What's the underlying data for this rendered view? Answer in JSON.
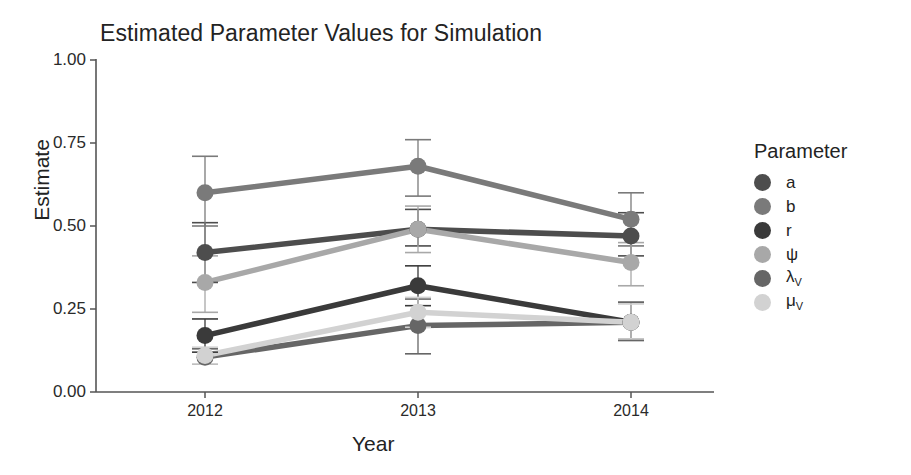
{
  "chart_data": {
    "type": "line",
    "title": "Estimated Parameter Values for Simulation",
    "xlabel": "Year",
    "ylabel": "Estimate",
    "x": [
      "2012",
      "2013",
      "2014"
    ],
    "categories": [
      "2012",
      "2013",
      "2014"
    ],
    "xtick_labels": [
      "2012",
      "2013",
      "2014"
    ],
    "ytick_labels": [
      "0.00",
      "0.25",
      "0.50",
      "0.75",
      "1.00"
    ],
    "ytick_values": [
      0.0,
      0.25,
      0.5,
      0.75,
      1.0
    ],
    "ylim": [
      0.0,
      1.0
    ],
    "grid": false,
    "legend_title": "Parameter",
    "legend_position": "right",
    "error_bars": "vertical, symmetric caps",
    "series": [
      {
        "name": "a",
        "label": "a",
        "color": "#4d4d4d",
        "values": [
          0.42,
          0.49,
          0.47
        ],
        "err_low": [
          0.33,
          0.44,
          0.41
        ],
        "err_high": [
          0.51,
          0.55,
          0.54
        ]
      },
      {
        "name": "b",
        "label": "b",
        "color": "#7a7a7a",
        "values": [
          0.6,
          0.68,
          0.52
        ],
        "err_low": [
          0.5,
          0.59,
          0.44
        ],
        "err_high": [
          0.71,
          0.76,
          0.6
        ]
      },
      {
        "name": "r",
        "label": "r",
        "color": "#3a3a3a",
        "values": [
          0.17,
          0.32,
          0.21
        ],
        "err_low": [
          0.12,
          0.26,
          0.16
        ],
        "err_high": [
          0.22,
          0.38,
          0.27
        ]
      },
      {
        "name": "psi",
        "label": "ψ",
        "color": "#a8a8a8",
        "values": [
          0.33,
          0.49,
          0.39
        ],
        "err_low": [
          0.24,
          0.42,
          0.32
        ],
        "err_high": [
          0.41,
          0.56,
          0.45
        ]
      },
      {
        "name": "lambda_v",
        "label": "λ",
        "sublabel": "V",
        "color": "#666666",
        "values": [
          0.105,
          0.2,
          0.21
        ],
        "err_low": [
          0.085,
          0.115,
          0.155
        ],
        "err_high": [
          0.13,
          0.28,
          0.27
        ]
      },
      {
        "name": "mu_v",
        "label": "μ",
        "sublabel": "V",
        "color": "#d2d2d2",
        "values": [
          0.11,
          0.24,
          0.21
        ],
        "err_low": [
          0.085,
          0.195,
          0.16
        ],
        "err_high": [
          0.135,
          0.285,
          0.265
        ]
      }
    ],
    "axis_color": "#555555",
    "background": "#ffffff"
  },
  "legend": {
    "title": "Parameter",
    "items": [
      {
        "label": "a",
        "sub": "",
        "color": "#4d4d4d"
      },
      {
        "label": "b",
        "sub": "",
        "color": "#7a7a7a"
      },
      {
        "label": "r",
        "sub": "",
        "color": "#3a3a3a"
      },
      {
        "label": "ψ",
        "sub": "",
        "color": "#a8a8a8"
      },
      {
        "label": "λ",
        "sub": "V",
        "color": "#666666"
      },
      {
        "label": "μ",
        "sub": "V",
        "color": "#d2d2d2"
      }
    ]
  }
}
